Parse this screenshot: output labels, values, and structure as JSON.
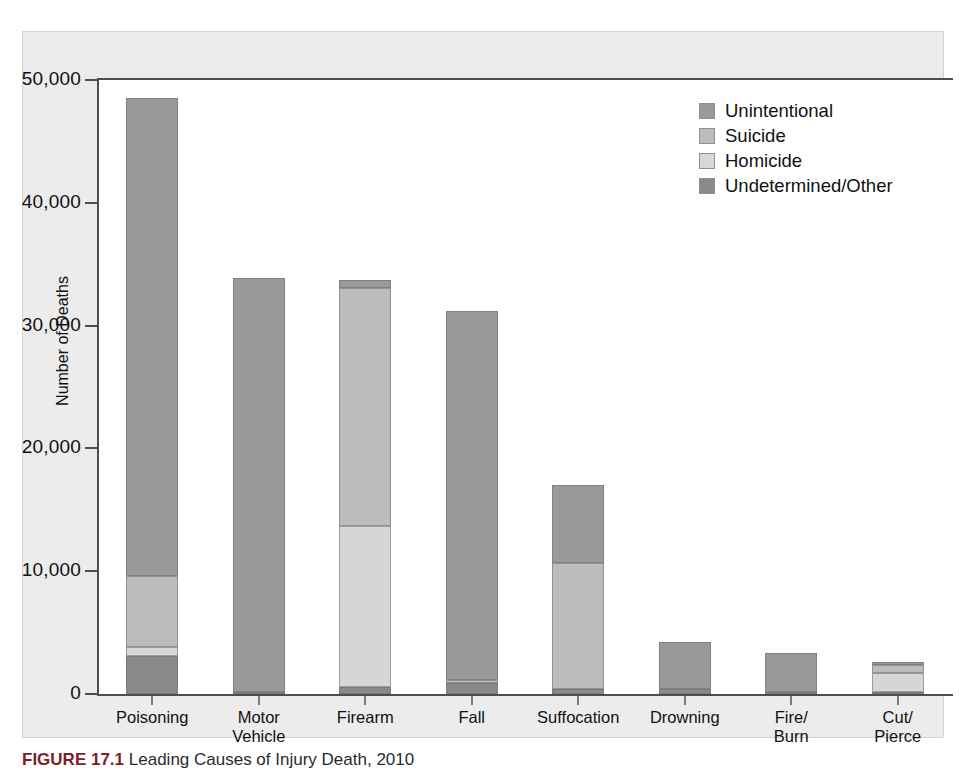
{
  "figure": {
    "caption_number": "FIGURE 17.1",
    "caption_text": "Leading Causes of Injury Death, 2010"
  },
  "chart_data": {
    "type": "bar",
    "subtype": "stacked-vertical",
    "title": "",
    "xlabel": "",
    "ylabel": "Number of Deaths",
    "ylim": [
      0,
      50000
    ],
    "ytick_values": [
      0,
      10000,
      20000,
      30000,
      40000,
      50000
    ],
    "ytick_labels": [
      "0",
      "10,000",
      "20,000",
      "30,000",
      "40,000",
      "50,000"
    ],
    "grid": false,
    "legend_position": "top-right",
    "categories": [
      "Poisoning",
      "Motor\nVehicle",
      "Firearm",
      "Fall",
      "Suffocation",
      "Drowning",
      "Fire/\nBurn",
      "Cut/\nPierce"
    ],
    "series": [
      {
        "name": "Unintentional",
        "color": "#9a9a9a",
        "values": [
          38900,
          33700,
          600,
          30100,
          6300,
          3800,
          3100,
          200
        ]
      },
      {
        "name": "Suicide",
        "color": "#bcbcbc",
        "values": [
          5800,
          0,
          19400,
          200,
          10300,
          0,
          0,
          700
        ]
      },
      {
        "name": "Homicide",
        "color": "#d6d6d6",
        "values": [
          700,
          0,
          13100,
          0,
          0,
          0,
          0,
          1500
        ]
      },
      {
        "name": "Undetermined/Other",
        "color": "#8a8a8a",
        "values": [
          3100,
          200,
          600,
          900,
          400,
          400,
          200,
          200
        ]
      }
    ],
    "stack_order_bottom_to_top": [
      "Undetermined/Other",
      "Homicide",
      "Suicide",
      "Unintentional"
    ],
    "totals": [
      48500,
      33900,
      33700,
      31200,
      17000,
      4200,
      3300,
      2600
    ]
  },
  "legend": {
    "items": [
      {
        "label": "Unintentional",
        "key": "unintentional"
      },
      {
        "label": "Suicide",
        "key": "suicide"
      },
      {
        "label": "Homicide",
        "key": "homicide"
      },
      {
        "label": "Undetermined/Other",
        "key": "undetermined"
      }
    ]
  }
}
